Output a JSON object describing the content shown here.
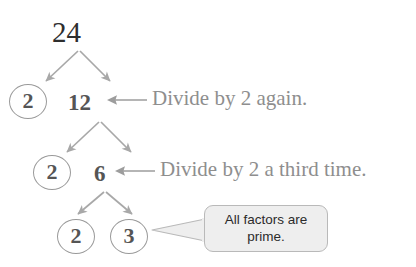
{
  "diagram": {
    "root": {
      "value": "24"
    },
    "rows": [
      {
        "circled_factor": "2",
        "quotient": "12",
        "annotation": "Divide by 2 again."
      },
      {
        "circled_factor": "2",
        "quotient": "6",
        "annotation": "Divide by 2 a third time."
      }
    ],
    "final_row": {
      "left_factor": "2",
      "right_factor": "3"
    },
    "callout": {
      "line1": "All factors are",
      "line2": "prime."
    },
    "arrow_glyph": "←"
  },
  "colors": {
    "root_number": "#2e2e2e",
    "branch_number": "#555555",
    "circle_stroke": "#9a9a9a",
    "branch_arrow": "#a8a8a8",
    "annotation_text": "#8e8e8e",
    "callout_fill": "#eeeeee",
    "callout_border": "#b9b9b9",
    "callout_text": "#2b2b2b",
    "background": "#ffffff"
  }
}
